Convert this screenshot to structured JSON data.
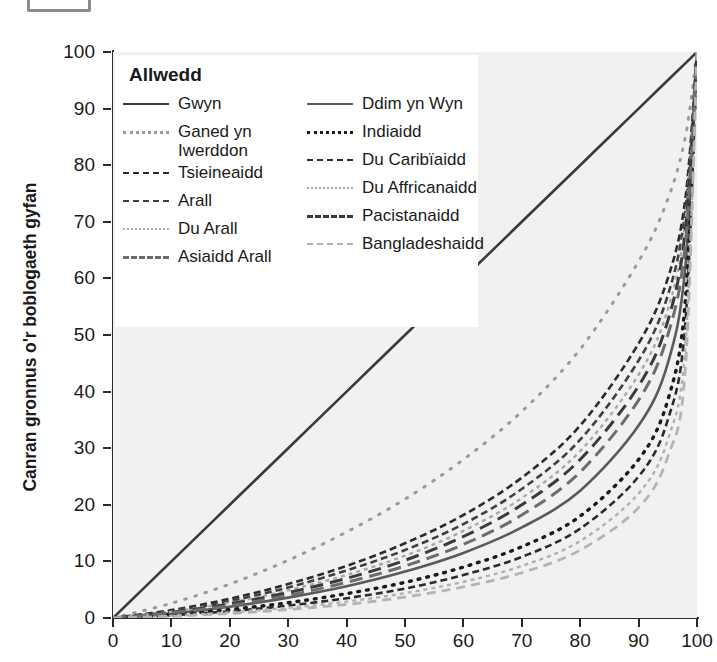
{
  "top_stub": {
    "name": "cropped-box-fragment"
  },
  "axes": {
    "ylabel": "Canran gronnus o'r boblogaeth gyfan",
    "xlabel": "",
    "yticks": [
      0,
      10,
      20,
      30,
      40,
      50,
      60,
      70,
      80,
      90,
      100
    ],
    "xticks": [
      0,
      10,
      20,
      30,
      40,
      50,
      60,
      70,
      80,
      90,
      100
    ],
    "ylim": [
      0,
      100
    ],
    "xlim": [
      0,
      100
    ],
    "plot_bg": "#f1f1f1",
    "axis_color": "#2b2b2b"
  },
  "legend": {
    "title": "Allwedd",
    "columns": [
      {
        "items": [
          {
            "label": "Gwyn",
            "style": "solid",
            "color": "#3a3a3a"
          },
          {
            "label": "Ganed yn Iwerddon",
            "style": "dotted-sparse",
            "color": "#9a9a9a"
          },
          {
            "label": "Tsieineaidd",
            "style": "dash-dot",
            "color": "#2b2b2b"
          },
          {
            "label": "Arall",
            "style": "dash-dot",
            "color": "#3f3f3f"
          },
          {
            "label": "Du Arall",
            "style": "dotted-fine",
            "color": "#b0b0b0"
          },
          {
            "label": "Asiaidd Arall",
            "style": "dashed-long",
            "color": "#6d6d6d"
          }
        ]
      },
      {
        "items": [
          {
            "label": "Ddim yn Wyn",
            "style": "solid",
            "color": "#5a5a5a"
          },
          {
            "label": "Indiaidd",
            "style": "dotted-round",
            "color": "#1a1a1a"
          },
          {
            "label": "Du Caribïaidd",
            "style": "dash-dot",
            "color": "#2b2b2b"
          },
          {
            "label": "Du Affricanaidd",
            "style": "dotted-fine",
            "color": "#a8a8a8"
          },
          {
            "label": "Pacistanaidd",
            "style": "dashed-long",
            "color": "#3a3a3a"
          },
          {
            "label": "Bangladeshaidd",
            "style": "dashed-med",
            "color": "#b4b4b4"
          }
        ]
      }
    ]
  },
  "chart_data": {
    "type": "line",
    "title": "",
    "xlabel": "",
    "ylabel": "Canran gronnus o'r boblogaeth gyfan",
    "xlim": [
      0,
      100
    ],
    "ylim": [
      0,
      100
    ],
    "grid": false,
    "legend_position": "top-left",
    "x": [
      0,
      10,
      20,
      30,
      40,
      50,
      60,
      70,
      80,
      90,
      95,
      98,
      100
    ],
    "series": [
      {
        "name": "Gwyn",
        "style": "solid",
        "color": "#3a3a3a",
        "values": [
          0,
          10,
          20,
          30,
          40,
          50,
          60,
          70,
          80,
          90,
          95,
          98,
          100
        ]
      },
      {
        "name": "Ddim yn Wyn",
        "style": "solid",
        "color": "#5a5a5a",
        "values": [
          0,
          0.8,
          2.0,
          3.6,
          5.6,
          8.2,
          11.5,
          16.0,
          22.5,
          34.0,
          45.0,
          62.0,
          100
        ]
      },
      {
        "name": "Ganed yn Iwerddon",
        "style": "dotted-sparse",
        "color": "#9a9a9a",
        "values": [
          0,
          2.6,
          6.0,
          10.2,
          15.2,
          21.0,
          28.0,
          36.5,
          47.5,
          63.0,
          74.0,
          85.0,
          100
        ]
      },
      {
        "name": "Indiaidd",
        "style": "dotted-round",
        "color": "#1a1a1a",
        "values": [
          0,
          0.6,
          1.5,
          2.7,
          4.3,
          6.3,
          9.0,
          12.6,
          18.0,
          28.0,
          38.5,
          56.0,
          100
        ]
      },
      {
        "name": "Tsieineaidd",
        "style": "dash-dot",
        "color": "#2b2b2b",
        "values": [
          0,
          1.4,
          3.4,
          6.0,
          9.2,
          13.2,
          18.2,
          24.8,
          34.0,
          48.5,
          60.0,
          74.0,
          100
        ]
      },
      {
        "name": "Du Caribïaidd",
        "style": "dash-dot",
        "color": "#2b2b2b",
        "values": [
          0,
          0.5,
          1.2,
          2.2,
          3.5,
          5.2,
          7.6,
          10.8,
          15.8,
          25.0,
          35.0,
          52.0,
          100
        ]
      },
      {
        "name": "Arall",
        "style": "dash-dot",
        "color": "#3f3f3f",
        "values": [
          0,
          1.2,
          3.0,
          5.4,
          8.4,
          12.0,
          16.6,
          22.8,
          31.5,
          45.5,
          57.0,
          72.0,
          100
        ]
      },
      {
        "name": "Du Affricanaidd",
        "style": "dotted-fine",
        "color": "#a8a8a8",
        "values": [
          0,
          1.1,
          2.7,
          4.9,
          7.6,
          11.0,
          15.4,
          21.2,
          29.5,
          43.0,
          54.5,
          70.0,
          100
        ]
      },
      {
        "name": "Du Arall",
        "style": "dotted-fine",
        "color": "#b0b0b0",
        "values": [
          0,
          0.4,
          1.0,
          1.8,
          2.9,
          4.4,
          6.4,
          9.2,
          13.6,
          22.0,
          31.5,
          48.0,
          100
        ]
      },
      {
        "name": "Pacistanaidd",
        "style": "dashed-long",
        "color": "#3a3a3a",
        "values": [
          0,
          1.0,
          2.5,
          4.5,
          7.0,
          10.2,
          14.4,
          20.0,
          28.0,
          41.0,
          52.5,
          68.5,
          100
        ]
      },
      {
        "name": "Asiaidd Arall",
        "style": "dashed-long",
        "color": "#6d6d6d",
        "values": [
          0,
          0.9,
          2.2,
          4.0,
          6.3,
          9.2,
          13.0,
          18.2,
          25.8,
          38.5,
          50.0,
          66.0,
          100
        ]
      },
      {
        "name": "Bangladeshaidd",
        "style": "dashed-med",
        "color": "#b4b4b4",
        "values": [
          0,
          0.3,
          0.8,
          1.5,
          2.4,
          3.7,
          5.5,
          8.0,
          12.0,
          19.5,
          28.5,
          44.0,
          100
        ]
      }
    ]
  }
}
